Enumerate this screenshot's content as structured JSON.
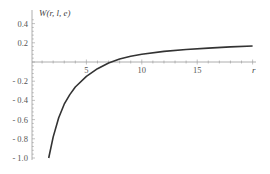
{
  "chart_data": {
    "type": "line",
    "title": "",
    "xlabel": "r",
    "ylabel": "W(r, l, e)",
    "xlim": [
      0,
      20
    ],
    "ylim": [
      -1.0,
      0.45
    ],
    "grid": false,
    "legend": null,
    "x_ticks": [
      5,
      10,
      15
    ],
    "x_tick_labels": [
      "5",
      "10",
      "15"
    ],
    "y_ticks": [
      0.4,
      0.2,
      -0.2,
      -0.4,
      -0.6,
      -0.8,
      -1.0
    ],
    "y_tick_labels": [
      "0.4",
      "0.2",
      "- 0.2",
      "- 0.4",
      "- 0.6",
      "- 0.8",
      "- 1.0"
    ],
    "series": [
      {
        "name": "W(r, l, e)",
        "color": "#333333",
        "x": [
          1.6,
          2,
          2.5,
          3,
          3.5,
          4,
          5,
          6,
          7,
          8,
          9,
          10,
          12,
          14,
          16,
          18,
          20
        ],
        "y": [
          -1.0,
          -0.78,
          -0.58,
          -0.44,
          -0.34,
          -0.26,
          -0.15,
          -0.07,
          -0.01,
          0.03,
          0.06,
          0.08,
          0.11,
          0.13,
          0.145,
          0.157,
          0.167
        ]
      }
    ]
  }
}
